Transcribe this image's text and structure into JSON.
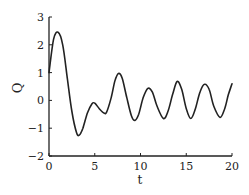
{
  "chart_data": {
    "type": "line",
    "title": "",
    "xlabel": "t",
    "ylabel": "Q",
    "xlim": [
      0,
      20
    ],
    "ylim": [
      -2,
      3
    ],
    "xticks": [
      0,
      5,
      10,
      15,
      20
    ],
    "yticks": [
      -2,
      -1,
      0,
      1,
      2,
      3
    ],
    "grid": false,
    "legend": null,
    "series": [
      {
        "name": "Q(t)",
        "color": "#222222",
        "x": [
          0,
          0.5,
          1.0,
          1.5,
          2.0,
          2.5,
          3.0,
          3.3,
          3.7,
          4.2,
          4.7,
          5.0,
          5.5,
          6.0,
          6.3,
          6.8,
          7.2,
          7.6,
          8.0,
          8.5,
          9.0,
          9.4,
          9.8,
          10.3,
          10.8,
          11.3,
          11.8,
          12.5,
          13.0,
          13.5,
          14.0,
          14.5,
          15.0,
          15.5,
          16.0,
          16.5,
          17.0,
          17.5,
          18.0,
          18.7,
          19.2,
          19.6,
          20.0
        ],
        "y": [
          1.0,
          2.2,
          2.45,
          2.0,
          0.8,
          -0.4,
          -1.15,
          -1.25,
          -1.0,
          -0.45,
          -0.12,
          -0.1,
          -0.3,
          -0.45,
          -0.42,
          0.1,
          0.7,
          0.97,
          0.8,
          0.1,
          -0.55,
          -0.72,
          -0.5,
          0.1,
          0.43,
          0.3,
          -0.2,
          -0.65,
          -0.4,
          0.2,
          0.68,
          0.4,
          -0.3,
          -0.65,
          -0.3,
          0.3,
          0.58,
          0.4,
          -0.2,
          -0.61,
          -0.3,
          0.2,
          0.6
        ]
      }
    ]
  }
}
